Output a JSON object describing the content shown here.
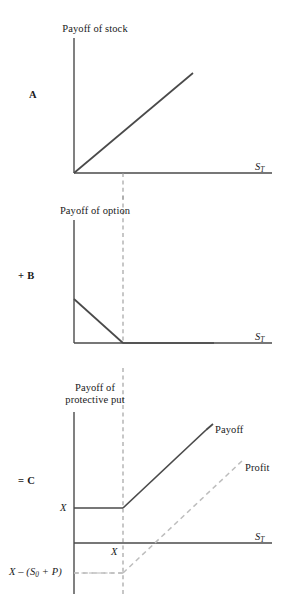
{
  "figure": {
    "type": "diagram",
    "panels": [
      {
        "id": "panel-a",
        "operator_label": "A",
        "y_axis_title": "Payoff of stock",
        "x_axis_label_main": "S",
        "x_axis_label_sub": "T",
        "curve_description": "45-degree line rising from origin",
        "dashed_strike_line": "vertical dashed line at X"
      },
      {
        "id": "panel-b",
        "operator_label": "+ B",
        "y_axis_title": "Payoff of option",
        "x_axis_label_main": "S",
        "x_axis_label_sub": "T",
        "curve_description": "put payoff declining to zero at X then flat",
        "dashed_strike_line": "vertical dashed line at X"
      },
      {
        "id": "panel-c",
        "operator_label": "= C",
        "y_axis_title_line1": "Payoff of",
        "y_axis_title_line2": "protective put",
        "x_axis_label_main": "S",
        "x_axis_label_sub": "T",
        "y_tick_label": "X",
        "x_tick_label": "X",
        "breakeven_label_main": "X – (S",
        "breakeven_label_sub": "0",
        "breakeven_label_tail": " + P)",
        "series": [
          {
            "name": "Payoff",
            "style": "solid",
            "label": "Payoff"
          },
          {
            "name": "Profit",
            "style": "dashed",
            "label": "Profit"
          }
        ],
        "dashed_strike_line": "vertical dashed line at X"
      }
    ],
    "colors": {
      "curve": "#4a4a4a",
      "axis": "#4a4a4a",
      "guide": "#9a9a9a",
      "profit": "#bdbdbd",
      "background": "#ffffff",
      "text": "#1a1a1a"
    }
  }
}
